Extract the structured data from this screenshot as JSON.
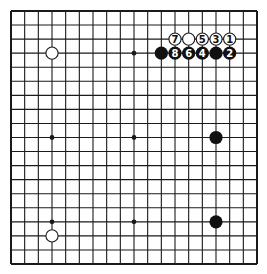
{
  "diagram": {
    "type": "go-board",
    "size": 19,
    "colors": {
      "background": "#ffffff",
      "line": "#1a1a1a",
      "black_stone": "#111111",
      "white_stone": "#ffffff",
      "white_stone_border": "#1a1a1a",
      "black_label": "#ffffff",
      "white_label": "#111111"
    },
    "star_points": [
      [
        3,
        3
      ],
      [
        9,
        3
      ],
      [
        15,
        3
      ],
      [
        3,
        9
      ],
      [
        9,
        9
      ],
      [
        15,
        9
      ],
      [
        3,
        15
      ],
      [
        9,
        15
      ],
      [
        15,
        15
      ]
    ],
    "stones": [
      {
        "color": "white",
        "x": 3,
        "y": 3,
        "label": ""
      },
      {
        "color": "white",
        "x": 16,
        "y": 2,
        "label": "1"
      },
      {
        "color": "black",
        "x": 16,
        "y": 3,
        "label": "2"
      },
      {
        "color": "white",
        "x": 15,
        "y": 2,
        "label": "3"
      },
      {
        "color": "black",
        "x": 14,
        "y": 3,
        "label": "4"
      },
      {
        "color": "white",
        "x": 14,
        "y": 2,
        "label": "5"
      },
      {
        "color": "black",
        "x": 13,
        "y": 3,
        "label": "6"
      },
      {
        "color": "white",
        "x": 12,
        "y": 2,
        "label": "7"
      },
      {
        "color": "black",
        "x": 12,
        "y": 3,
        "label": "8"
      },
      {
        "color": "white",
        "x": 13,
        "y": 2,
        "label": ""
      },
      {
        "color": "black",
        "x": 11,
        "y": 3,
        "label": ""
      },
      {
        "color": "black",
        "x": 15,
        "y": 3,
        "label": ""
      },
      {
        "color": "black",
        "x": 15,
        "y": 9,
        "label": ""
      },
      {
        "color": "black",
        "x": 15,
        "y": 15,
        "label": ""
      },
      {
        "color": "white",
        "x": 3,
        "y": 16,
        "label": ""
      }
    ]
  }
}
